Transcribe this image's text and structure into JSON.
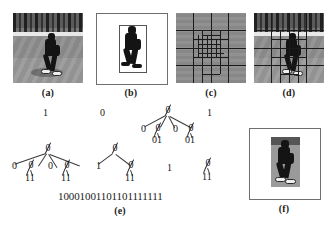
{
  "figure": {
    "panels": [
      {
        "id": "a",
        "caption": "(a)",
        "kind": "grayscale-photo",
        "description": "pedestrian walking scene"
      },
      {
        "id": "b",
        "caption": "(b)",
        "kind": "silhouette",
        "description": "binary silhouette with bounding box"
      },
      {
        "id": "c",
        "caption": "(c)",
        "kind": "quadtree-grid",
        "description": "quadtree partition grid"
      },
      {
        "id": "d",
        "caption": "(d)",
        "kind": "grid-overlay",
        "description": "quadtree grid overlaid on photo"
      },
      {
        "id": "e",
        "caption": "(e)",
        "kind": "quadtree-code",
        "description": "quadtree node trees and bit string"
      },
      {
        "id": "f",
        "caption": "(f)",
        "kind": "cropped-region",
        "description": "reconstructed cropped person region"
      }
    ],
    "colors": {
      "ink": "#181818",
      "edge": "#3a3a3a",
      "silhouette": "#141414",
      "page": "#ffffff",
      "ground": "#8f8f8f",
      "stripe": "#e8e8e8",
      "treeband": "#4a4a4a"
    }
  },
  "code": {
    "top_row": [
      {
        "label": "1",
        "type": "leaf-one"
      },
      {
        "label": "0",
        "type": "leaf-zero"
      },
      {
        "label": "1",
        "type": "leaf-one"
      }
    ],
    "standalone_one": "1",
    "trees": [
      {
        "name": "tree-upper-right",
        "root": "0",
        "children": [
          "0",
          "0",
          "0",
          "0"
        ],
        "grandchildren": [
          "01",
          "01"
        ]
      },
      {
        "name": "tree-left",
        "root": "0",
        "children": [
          "0",
          "0",
          "0",
          "0"
        ],
        "grandchildren": [
          "11",
          "11"
        ]
      },
      {
        "name": "tree-middle",
        "root": "0",
        "children": [
          "1",
          "0"
        ],
        "grandchildren": [
          "11"
        ]
      },
      {
        "name": "tree-right-small",
        "root": "0",
        "children": [
          "11"
        ],
        "grandchildren": []
      }
    ],
    "bit_string": "10001001101101111111"
  }
}
